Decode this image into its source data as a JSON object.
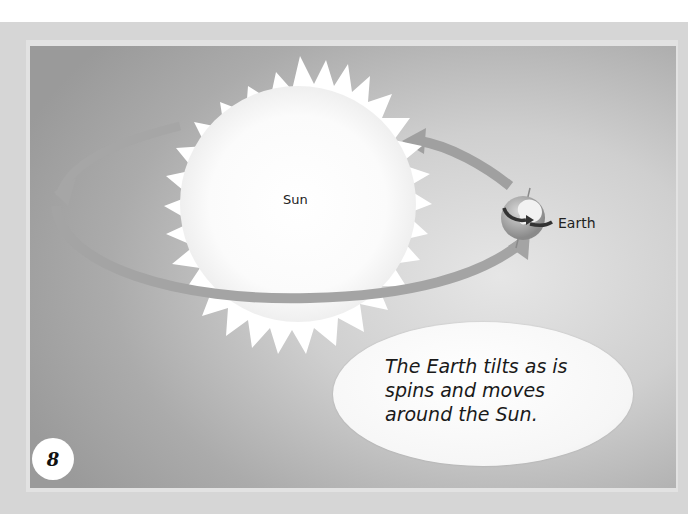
{
  "illustration": {
    "sun_label": "Sun",
    "earth_label": "Earth"
  },
  "caption": {
    "text": "The Earth tilts as is spins and moves around the Sun."
  },
  "page": {
    "number": "8"
  },
  "colors": {
    "panel_dark": "#9a9a9a",
    "panel_light": "#e6e6e6",
    "sun": "#ffffff",
    "orbit": "#a8a8a8",
    "text": "#1a1a1a"
  }
}
